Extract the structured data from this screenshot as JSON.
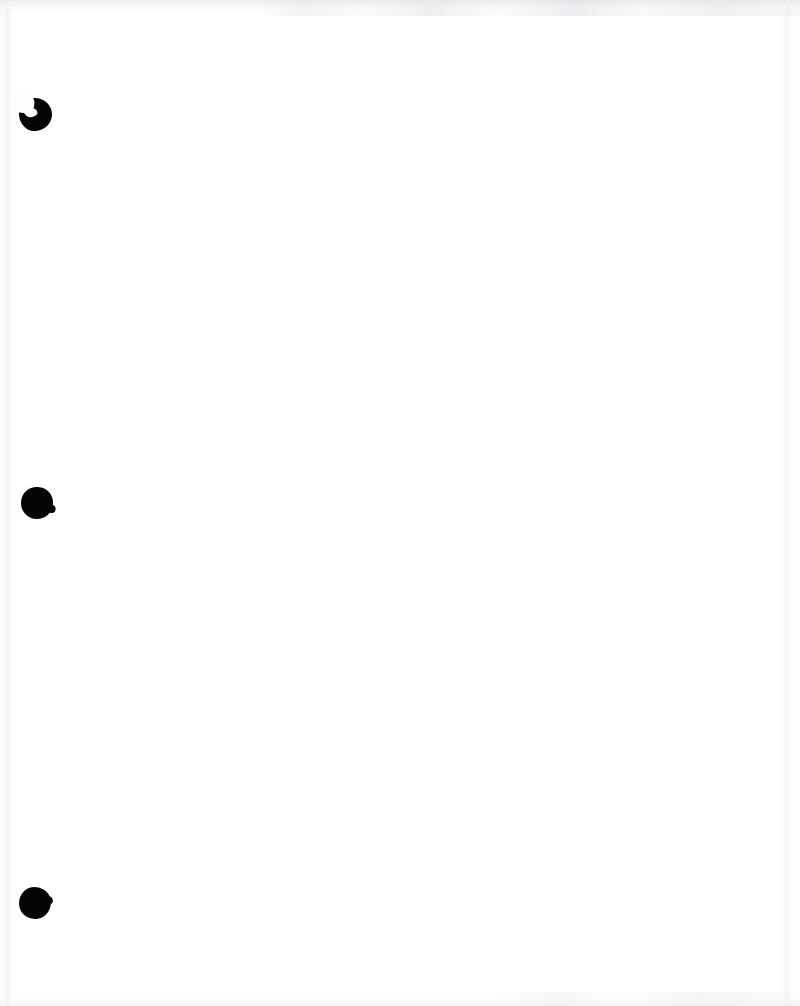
{
  "page": {
    "kind": "scanned-document-page",
    "width": 800,
    "height": 1006,
    "background_color": "#fdfdfd",
    "content_text": "",
    "is_blank": true
  },
  "punch_holes": {
    "count": 3,
    "ink_color": "#050505",
    "items": [
      {
        "name": "punch-hole-top",
        "center_x": 35,
        "center_y": 115,
        "diameter": 33,
        "shape": "torn-crescent",
        "note": "partial punch with bite notch at upper-left"
      },
      {
        "name": "punch-hole-middle",
        "center_x": 37,
        "center_y": 503,
        "diameter": 32,
        "shape": "round",
        "note": "small nub on lower-right edge"
      },
      {
        "name": "punch-hole-bottom",
        "center_x": 35,
        "center_y": 903,
        "diameter": 32,
        "shape": "round-polygonal",
        "note": "slightly faceted circle"
      }
    ]
  },
  "scan_artifacts": {
    "top_edge": {
      "name": "top-scan-smudge",
      "color": "#e0e0e4",
      "description": "faint gray scanner band across top edge, stronger right of center"
    },
    "bottom_edge": {
      "name": "bottom-scan-smudge",
      "color": "#e8e8ec",
      "description": "faint gray scanner texture across bottom edge"
    },
    "left_edge": {
      "name": "left-page-edge",
      "color": "#ececf0",
      "description": "subtle vertical page edge shading near x=8"
    },
    "right_edge": {
      "name": "right-page-edge",
      "color": "#eeeef2",
      "description": "subtle vertical page edge shading near x=788"
    }
  }
}
